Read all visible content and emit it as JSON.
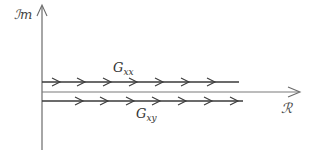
{
  "diagram": {
    "type": "complex-plane-paths",
    "axes": {
      "vertical_label": "ℐm",
      "horizontal_label": "ℛ",
      "colors": {
        "axis": "#6b6b6b",
        "path": "#3a3a3a",
        "text": "#333333"
      }
    },
    "paths": [
      {
        "id": "gxx",
        "label_main": "G",
        "label_sub": "xx",
        "position": "above real axis",
        "arrow_count": 7,
        "direction": "right"
      },
      {
        "id": "gxy",
        "label_main": "G",
        "label_sub": "xy",
        "position": "below real axis",
        "arrow_count": 7,
        "direction": "right"
      }
    ]
  }
}
